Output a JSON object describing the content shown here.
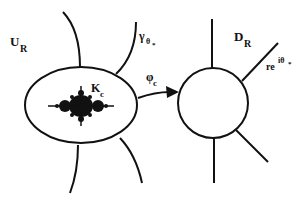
{
  "diagram": {
    "type": "conformal-map-diagram",
    "labels": {
      "U_R": {
        "main": "U",
        "sub": "R"
      },
      "gamma": {
        "main": "γ",
        "sub": "θ",
        "subsub": "*"
      },
      "K_c": {
        "main": "K",
        "sub": "c"
      },
      "phi_c": {
        "main": "φ",
        "sub": "c"
      },
      "D_R": {
        "main": "D",
        "sub": "R"
      },
      "ray": {
        "main": "re",
        "sup": "iθ",
        "supsub": "*"
      }
    },
    "shapes": {
      "left_domain": "ellipse containing Mandelbrot set",
      "right_domain": "circle (unit disk)",
      "mapping_arrow": "φ_c from ellipse to circle"
    },
    "colors": {
      "stroke": "#111111",
      "fill_set": "#111111",
      "background": "#ffffff"
    }
  }
}
